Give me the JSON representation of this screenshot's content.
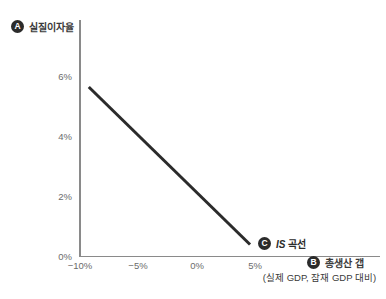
{
  "chart_data": {
    "type": "line",
    "title": "",
    "xlabel": "총생산 갭",
    "xlabel_sub": "(실제 GDP, 잠재 GDP 대비)",
    "ylabel": "실질이자율",
    "xlim": [
      -11.2,
      15.0
    ],
    "ylim": [
      0,
      7.95
    ],
    "xticks": [
      -10,
      -5,
      0,
      5
    ],
    "xticklabels": [
      "−10%",
      "−5%",
      "0%",
      "5%"
    ],
    "yticks": [
      0,
      2,
      4,
      6
    ],
    "yticklabels": [
      "0%",
      "2%",
      "4%",
      "6%"
    ],
    "grid": false,
    "legend": "none",
    "series": [
      {
        "name": "IS 곡선",
        "name_italic_prefix": "IS",
        "name_suffix": " 곡선",
        "color": "#2b2b2b",
        "linewidth": 3,
        "x": [
          -9.2,
          4.7
        ],
        "y": [
          5.65,
          0.4
        ]
      }
    ],
    "annotations": [
      {
        "badge": "A",
        "text": "실질이자율",
        "target": "y-axis"
      },
      {
        "badge": "B",
        "text": "총생산 갭",
        "target": "x-axis"
      },
      {
        "badge": "C",
        "text": "IS 곡선",
        "target": "series-end"
      }
    ]
  },
  "colors": {
    "background": "#ffffff",
    "axis": "#8a8a8a",
    "line": "#2b2b2b",
    "badge_bg": "#2b2b2b",
    "badge_fg": "#ffffff",
    "tick_text": "#6b6b6b",
    "label_text": "#3a3a3a"
  },
  "badges": {
    "a": "A",
    "b": "B",
    "c": "C"
  },
  "labels": {
    "y_axis": "실질이자율",
    "x_axis": "총생산 갭",
    "x_axis_sub": "(실제 GDP, 잠재 GDP 대비)",
    "series_italic": "IS",
    "series_rest": " 곡선"
  },
  "ticks": {
    "y": [
      "6%",
      "4%",
      "2%",
      "0%"
    ],
    "x": [
      "−10%",
      "−5%",
      "0%",
      "5%"
    ]
  }
}
